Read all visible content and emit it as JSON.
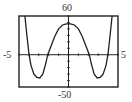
{
  "chart_data": {
    "type": "line",
    "title": "",
    "xlabel": "",
    "ylabel": "",
    "xlim": [
      -5,
      5
    ],
    "ylim": [
      -50,
      60
    ],
    "x_tick_step": 1,
    "y_tick_step": 10,
    "grid": false,
    "legend": null,
    "window_labels": {
      "xmin": "-5",
      "xmax": "5",
      "ymin": "-50",
      "ymax": "60"
    },
    "series": [
      {
        "name": "f(x)",
        "x": [
          -4.4,
          -4.2,
          -4.0,
          -3.8,
          -3.5,
          -3.2,
          -2.9,
          -2.6,
          -2.3,
          -2.1,
          -1.8,
          -1.4,
          -1.0,
          -0.6,
          -0.3,
          0.0,
          0.3,
          0.6,
          1.0,
          1.4,
          1.8,
          2.1,
          2.3,
          2.6,
          2.9,
          3.2,
          3.5,
          3.8,
          4.0,
          4.2,
          4.4
        ],
        "y": [
          60,
          30,
          2,
          -16,
          -30,
          -35,
          -36,
          -30,
          -14,
          0,
          12,
          28,
          40,
          46,
          47.5,
          48,
          47.5,
          46,
          40,
          28,
          12,
          0,
          -14,
          -30,
          -36,
          -35,
          -30,
          -16,
          2,
          30,
          60
        ]
      }
    ],
    "key_points": {
      "local_max": [
        0,
        48
      ],
      "local_mins": [
        [
          -2.9,
          -36
        ],
        [
          2.9,
          -36
        ]
      ],
      "x_intercepts": [
        -4.0,
        -2.1,
        2.1,
        4.0
      ]
    }
  }
}
